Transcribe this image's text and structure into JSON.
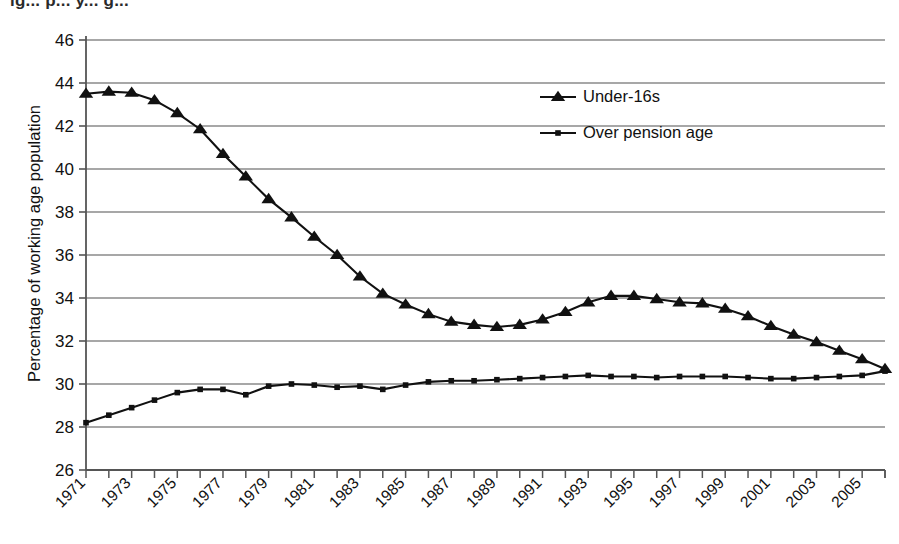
{
  "figure": {
    "cropped_title_fragment": "ig... p... y... g...",
    "ylabel": "Percentage of working age population",
    "xlabel": ""
  },
  "legend": {
    "position": "upper-right-inside",
    "entries": [
      {
        "label": "Under-16s",
        "marker": "triangle-up-icon",
        "color": "#111111"
      },
      {
        "label": "Over pension age",
        "marker": "square-icon",
        "color": "#111111"
      }
    ]
  },
  "axes": {
    "y_ticks": [
      26,
      28,
      30,
      32,
      34,
      36,
      38,
      40,
      42,
      44,
      46
    ],
    "x_ticks_labeled": [
      1971,
      1973,
      1975,
      1977,
      1979,
      1981,
      1983,
      1985,
      1987,
      1989,
      1991,
      1993,
      1995,
      1997,
      1999,
      2001,
      2003,
      2005
    ],
    "x_label_rotation_deg": -45,
    "grid": "horizontal"
  },
  "chart_data": {
    "type": "line",
    "title": "",
    "xlabel": "",
    "ylabel": "Percentage of working age population",
    "xlim": [
      1971,
      2006
    ],
    "ylim": [
      26,
      46
    ],
    "ytick_step": 2,
    "grid": true,
    "legend_position": "upper right",
    "x": [
      1971,
      1972,
      1973,
      1974,
      1975,
      1976,
      1977,
      1978,
      1979,
      1980,
      1981,
      1982,
      1983,
      1984,
      1985,
      1986,
      1987,
      1988,
      1989,
      1990,
      1991,
      1992,
      1993,
      1994,
      1995,
      1996,
      1997,
      1998,
      1999,
      2000,
      2001,
      2002,
      2003,
      2004,
      2005,
      2006
    ],
    "series": [
      {
        "name": "Under-16s",
        "marker": "triangle",
        "values": [
          43.5,
          43.6,
          43.55,
          43.2,
          42.6,
          41.85,
          40.7,
          39.65,
          38.6,
          37.75,
          36.85,
          36.0,
          35.0,
          34.2,
          33.7,
          33.25,
          32.9,
          32.75,
          32.65,
          32.75,
          33.0,
          33.35,
          33.8,
          34.1,
          34.1,
          33.95,
          33.8,
          33.75,
          33.5,
          33.15,
          32.7,
          32.3,
          31.95,
          31.55,
          31.15,
          30.7
        ]
      },
      {
        "name": "Over pension age",
        "marker": "square",
        "values": [
          28.2,
          28.55,
          28.9,
          29.25,
          29.6,
          29.75,
          29.75,
          29.5,
          29.9,
          30.0,
          29.95,
          29.85,
          29.9,
          29.75,
          29.95,
          30.1,
          30.15,
          30.15,
          30.2,
          30.25,
          30.3,
          30.35,
          30.4,
          30.35,
          30.35,
          30.3,
          30.35,
          30.35,
          30.35,
          30.3,
          30.25,
          30.25,
          30.3,
          30.35,
          30.4,
          30.6
        ]
      }
    ]
  },
  "style": {
    "line_color": "#111111",
    "grid_color": "#8a8a8a",
    "axis_color": "#555555",
    "background": "#ffffff"
  }
}
